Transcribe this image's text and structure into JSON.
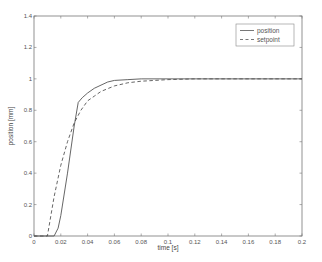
{
  "chart_data": {
    "type": "line",
    "title": "",
    "xlabel": "time [s]",
    "ylabel": "position [mm]",
    "xlim": [
      0,
      0.2
    ],
    "ylim": [
      0,
      1.4
    ],
    "xticks": [
      0,
      0.02,
      0.04,
      0.06,
      0.08,
      0.1,
      0.12,
      0.14,
      0.16,
      0.18,
      0.2
    ],
    "xtick_labels": [
      "0",
      "0.02",
      "0.04",
      "0.06",
      "0.08",
      "0.1",
      "0.12",
      "0.14",
      "0.16",
      "0.18",
      "0.2"
    ],
    "yticks": [
      0,
      0.2,
      0.4,
      0.6,
      0.8,
      1,
      1.2,
      1.4
    ],
    "ytick_labels": [
      "0",
      "0.2",
      "0.4",
      "0.6",
      "0.8",
      "1",
      "1.2",
      "1.4"
    ],
    "grid": false,
    "legend_position": "top-right",
    "series": [
      {
        "name": "position",
        "style": "solid",
        "color": "#555555",
        "x": [
          0,
          0.015,
          0.018,
          0.02,
          0.025,
          0.03,
          0.033,
          0.036,
          0.04,
          0.045,
          0.05,
          0.055,
          0.06,
          0.07,
          0.08,
          0.1,
          0.12,
          0.15,
          0.2
        ],
        "y": [
          0,
          0,
          0.05,
          0.13,
          0.4,
          0.7,
          0.85,
          0.88,
          0.91,
          0.94,
          0.96,
          0.98,
          0.99,
          0.995,
          1.0,
          1.0,
          1.0,
          1.0,
          1.0
        ]
      },
      {
        "name": "setpoint",
        "style": "dashed",
        "color": "#555555",
        "x": [
          0,
          0.01,
          0.015,
          0.02,
          0.025,
          0.03,
          0.035,
          0.04,
          0.045,
          0.05,
          0.06,
          0.07,
          0.08,
          0.1,
          0.12,
          0.15,
          0.2
        ],
        "y": [
          0,
          0,
          0.25,
          0.45,
          0.6,
          0.72,
          0.8,
          0.86,
          0.89,
          0.92,
          0.955,
          0.975,
          0.985,
          0.995,
          1.0,
          1.0,
          1.0
        ]
      }
    ]
  }
}
